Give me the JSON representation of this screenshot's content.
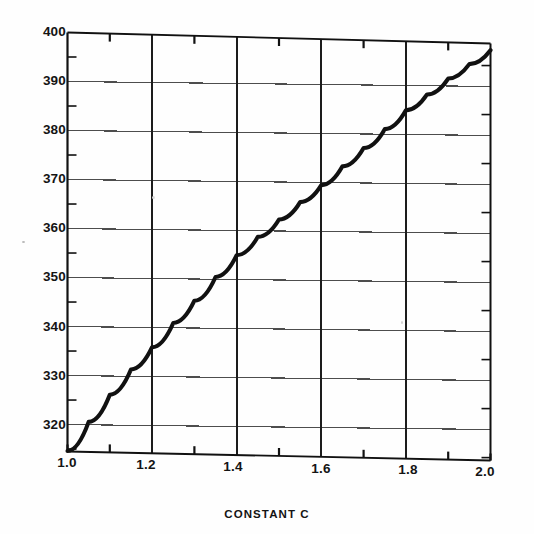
{
  "chart_data": {
    "type": "line",
    "title": "",
    "xlabel": "CONSTANT C",
    "ylabel": "",
    "xlim": [
      1.0,
      2.0
    ],
    "ylim": [
      314.5,
      400
    ],
    "grid": true,
    "legend_position": "none",
    "x_major_ticks": [
      1.0,
      1.2,
      1.4,
      1.6,
      1.8,
      2.0
    ],
    "x_minor_ticks": [
      1.1,
      1.3,
      1.5,
      1.7,
      1.9
    ],
    "y_major_ticks": [
      320,
      330,
      340,
      350,
      360,
      370,
      380,
      390,
      400
    ],
    "y_minor_ticks": [
      315,
      325,
      335,
      345,
      355,
      365,
      375,
      385,
      395
    ],
    "x_tick_labels": [
      "1.0",
      "1.2",
      "1.4",
      "1.6",
      "1.8",
      "2.0"
    ],
    "y_tick_labels": [
      "320",
      "330",
      "340",
      "350",
      "360",
      "370",
      "380",
      "390",
      "400"
    ],
    "series": [
      {
        "name": "curve",
        "x": [
          1.0,
          1.05,
          1.1,
          1.15,
          1.2,
          1.25,
          1.3,
          1.35,
          1.4,
          1.45,
          1.5,
          1.55,
          1.6,
          1.65,
          1.7,
          1.75,
          1.8,
          1.85,
          1.9,
          1.95,
          2.0
        ],
        "y": [
          314.6,
          320.6,
          326.2,
          331.4,
          336.0,
          341.0,
          345.6,
          350.5,
          355.0,
          358.8,
          362.4,
          366.0,
          369.5,
          373.4,
          377.2,
          381.1,
          385.0,
          388.3,
          391.6,
          394.6,
          397.5
        ]
      }
    ],
    "annotations": []
  },
  "figure": {
    "background_color": "#fefefe",
    "line_color": "#111111",
    "grid_color": "#4d4d4d",
    "axis_color": "#111111",
    "text_color": "#141414"
  }
}
